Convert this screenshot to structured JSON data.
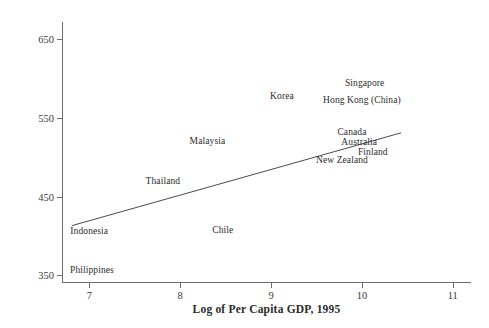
{
  "chart_data": {
    "type": "scatter",
    "title": "",
    "xlabel": "Log of Per Capita GDP, 1995",
    "ylabel": "Mathematics Score, 1998 TIMSS",
    "xlim": [
      6.7,
      11.2
    ],
    "ylim": [
      340,
      672
    ],
    "xticks": [
      7,
      8,
      9,
      10,
      11
    ],
    "xtick_labels": [
      "7",
      "8",
      "9",
      "10",
      "11"
    ],
    "yticks": [
      350,
      450,
      550,
      650
    ],
    "ytick_labels": [
      "350",
      "450",
      "550",
      "650"
    ],
    "grid": false,
    "legend": "none",
    "point_style": "text-label",
    "points": [
      {
        "label": "Philippines",
        "x": 7.03,
        "y": 356
      },
      {
        "label": "Indonesia",
        "x": 7.0,
        "y": 406
      },
      {
        "label": "Thailand",
        "x": 7.81,
        "y": 470
      },
      {
        "label": "Chile",
        "x": 8.47,
        "y": 408
      },
      {
        "label": "Malaysia",
        "x": 8.3,
        "y": 521
      },
      {
        "label": "Korea",
        "x": 9.12,
        "y": 578
      },
      {
        "label": "New Zealand",
        "x": 9.78,
        "y": 496
      },
      {
        "label": "Canada",
        "x": 9.89,
        "y": 532
      },
      {
        "label": "Australia",
        "x": 9.97,
        "y": 519
      },
      {
        "label": "Finland",
        "x": 10.12,
        "y": 507
      },
      {
        "label": "Hong Kong (China)",
        "x": 10.0,
        "y": 573
      },
      {
        "label": "Singapore",
        "x": 10.03,
        "y": 594
      }
    ],
    "fit_line": {
      "name": "regression line",
      "x_start": 6.81,
      "y_start": 413,
      "x_end": 10.43,
      "y_end": 531,
      "color": "#4a4a4a"
    },
    "colors": {
      "axis": "#6e6e6e",
      "text": "#2b2b2b",
      "tick_text": "#3a3a3a",
      "background": "#ffffff",
      "line": "#4a4a4a"
    }
  }
}
